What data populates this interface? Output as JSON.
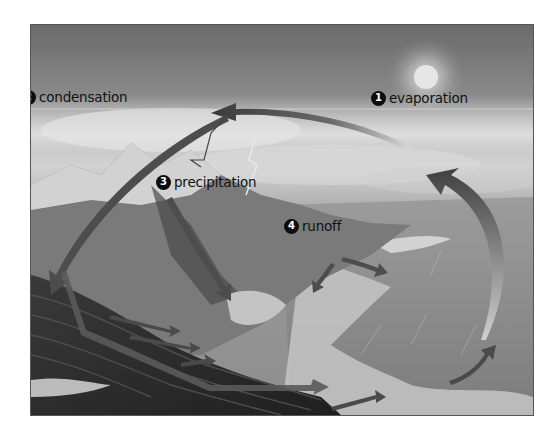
{
  "diagram": {
    "stages": [
      {
        "number": "1",
        "label": "evaporation"
      },
      {
        "number": "2",
        "label": "condensation"
      },
      {
        "number": "3",
        "label": "precipitation"
      },
      {
        "number": "4",
        "label": "runoff"
      }
    ],
    "colors": {
      "sky_dark": "#6a6a6a",
      "cloud_light": "#d8d8d8",
      "mountain": "#6e6e6e",
      "rock_dark": "#2e2e2e",
      "ocean": "#8f8f8f",
      "shore_light": "#c8c8c8",
      "arrow": "#4a4a4a",
      "sun": "#e8e8e8",
      "badge": "#0d0d0d"
    }
  }
}
